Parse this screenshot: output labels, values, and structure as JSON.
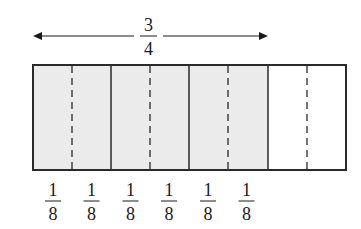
{
  "diagram": {
    "type": "fraction-bar",
    "total_parts_quarters": 4,
    "total_parts_eighths": 8,
    "shaded_quarters": 3,
    "shaded_eighths": 6,
    "colors": {
      "shaded_fill": "#ebebeb",
      "unshaded_fill": "#ffffff",
      "stroke": "#2a2a2a"
    },
    "top_label": {
      "numerator": "3",
      "denominator": "4",
      "spans": "first three fourths (double-headed arrow)"
    },
    "bottom_labels": [
      {
        "numerator": "1",
        "denominator": "8"
      },
      {
        "numerator": "1",
        "denominator": "8"
      },
      {
        "numerator": "1",
        "denominator": "8"
      },
      {
        "numerator": "1",
        "denominator": "8"
      },
      {
        "numerator": "1",
        "denominator": "8"
      },
      {
        "numerator": "1",
        "denominator": "8"
      }
    ]
  }
}
